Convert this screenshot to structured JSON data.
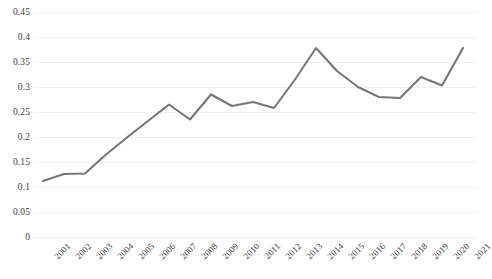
{
  "chart_data": {
    "type": "line",
    "title": "",
    "subtitle": "",
    "xlabel": "",
    "ylabel": "",
    "categories": [
      "2001",
      "2002",
      "2003",
      "2004",
      "2005",
      "2006",
      "2007",
      "2008",
      "2009",
      "2010",
      "2011",
      "2012",
      "2013",
      "2014",
      "2015",
      "2016",
      "2017",
      "2018",
      "2019",
      "2020",
      "2021"
    ],
    "series": [
      {
        "name": "",
        "color": "#767676",
        "values": [
          0.112,
          0.126,
          0.127,
          0.165,
          0.199,
          0.232,
          0.265,
          0.235,
          0.285,
          0.262,
          0.27,
          0.258,
          0.315,
          0.378,
          0.332,
          0.3,
          0.28,
          0.278,
          0.32,
          0.303,
          0.378
        ]
      }
    ],
    "y_ticks": [
      "0",
      "0.05",
      "0.1",
      "0.15",
      "0.2",
      "0.25",
      "0.3",
      "0.35",
      "0.4",
      "0.45"
    ],
    "y_tick_values": [
      0,
      0.05,
      0.1,
      0.15,
      0.2,
      0.25,
      0.3,
      0.35,
      0.4,
      0.45
    ],
    "ylim": [
      0,
      0.45
    ],
    "xlim": [
      "2001",
      "2021"
    ],
    "grid": true,
    "grid_color": "#f0f0f0",
    "legend": false,
    "legend_position": "none",
    "annotations": []
  }
}
